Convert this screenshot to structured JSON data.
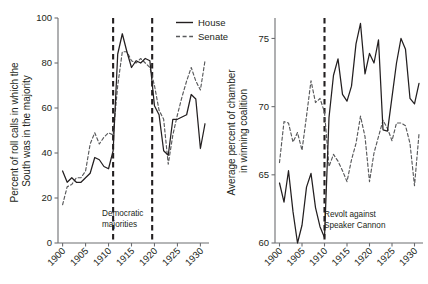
{
  "figure": {
    "title": "",
    "background": "#ffffff",
    "house_color": "#231f20",
    "senate_color": "#58595b"
  },
  "legend": {
    "position": "top-center",
    "entries": [
      {
        "label": "House",
        "style": "solid"
      },
      {
        "label": "Senate",
        "style": "dashed"
      }
    ]
  },
  "chart_data": [
    {
      "type": "line",
      "panel": "left",
      "title": "",
      "xlabel": "",
      "ylabel": "Percent of roll calls in which the South was in the majority",
      "xlim": [
        1899,
        1931
      ],
      "ylim": [
        0,
        100
      ],
      "xticks": [
        1900,
        1905,
        1910,
        1915,
        1920,
        1925,
        1930
      ],
      "xticklabels": [
        "1900",
        "1905",
        "1910",
        "1915",
        "1920",
        "1925",
        "1930"
      ],
      "yticks": [
        0,
        20,
        40,
        60,
        80,
        100
      ],
      "yticklabels": [
        "0",
        "20",
        "40",
        "60",
        "80",
        "100"
      ],
      "grid": false,
      "annotations": [
        {
          "text": "Democratic majorities",
          "x": 1915,
          "y": 12,
          "lines": [
            "Democratic",
            "majorities"
          ]
        }
      ],
      "vlines": [
        {
          "x": 1911,
          "style": "dashed"
        },
        {
          "x": 1919.5,
          "style": "dashed"
        }
      ],
      "x": [
        1900,
        1901,
        1902,
        1903,
        1904,
        1905,
        1906,
        1907,
        1908,
        1909,
        1910,
        1911,
        1912,
        1913,
        1914,
        1915,
        1916,
        1917,
        1918,
        1919,
        1920,
        1921,
        1922,
        1923,
        1924,
        1925,
        1926,
        1927,
        1928,
        1929,
        1930,
        1931
      ],
      "series": [
        {
          "name": "House",
          "style": "solid",
          "values": [
            32,
            27,
            29,
            27,
            27,
            29,
            31,
            38,
            37,
            34,
            33,
            41,
            84,
            93,
            85,
            78,
            81,
            80,
            82,
            81,
            61,
            57,
            41,
            39,
            55,
            55,
            56,
            57,
            66,
            64,
            42,
            53
          ]
        },
        {
          "name": "Senate",
          "style": "dashed",
          "values": [
            17,
            25,
            26,
            29,
            29,
            32,
            44,
            49,
            44,
            47,
            49,
            48,
            70,
            85,
            85,
            81,
            80,
            82,
            80,
            78,
            70,
            59,
            55,
            35,
            48,
            57,
            65,
            72,
            78,
            72,
            68,
            81
          ]
        }
      ]
    },
    {
      "type": "line",
      "panel": "right",
      "title": "",
      "xlabel": "",
      "ylabel": "Average percent of chamber in winning coalition",
      "xlim": [
        1899,
        1931
      ],
      "ylim": [
        60,
        76.5
      ],
      "xticks": [
        1900,
        1905,
        1910,
        1915,
        1920,
        1925,
        1930
      ],
      "xticklabels": [
        "1900",
        "1905",
        "1910",
        "1915",
        "1920",
        "1925",
        "1930"
      ],
      "yticks": [
        60,
        65,
        70,
        75
      ],
      "yticklabels": [
        "60",
        "65",
        "70",
        "75"
      ],
      "grid": false,
      "annotations": [
        {
          "text": "Revolt against Speaker Cannon",
          "x": 1912,
          "y": 61.5,
          "lines": [
            "Revolt against",
            "Speaker Cannon"
          ]
        }
      ],
      "vlines": [
        {
          "x": 1910,
          "style": "dashed"
        }
      ],
      "x": [
        1900,
        1901,
        1902,
        1903,
        1904,
        1905,
        1906,
        1907,
        1908,
        1909,
        1910,
        1911,
        1912,
        1913,
        1914,
        1915,
        1916,
        1917,
        1918,
        1919,
        1920,
        1921,
        1922,
        1923,
        1924,
        1925,
        1926,
        1927,
        1928,
        1929,
        1930,
        1931
      ],
      "series": [
        {
          "name": "House",
          "style": "solid",
          "values": [
            64.4,
            63.0,
            65.3,
            62.3,
            60.0,
            61.3,
            64.1,
            65.1,
            62.6,
            61.2,
            60.4,
            69.2,
            72.3,
            73.5,
            70.9,
            70.4,
            71.5,
            74.6,
            76.1,
            72.4,
            73.9,
            73.2,
            74.9,
            68.3,
            68.2,
            70.7,
            73.2,
            75.0,
            74.2,
            70.6,
            70.2,
            71.7
          ]
        },
        {
          "name": "Senate",
          "style": "dashed",
          "values": [
            65.9,
            68.9,
            68.8,
            67.4,
            68.1,
            66.8,
            69.3,
            71.9,
            70.3,
            70.6,
            69.6,
            65.6,
            66.5,
            66.0,
            65.3,
            64.5,
            66.1,
            67.3,
            69.3,
            67.8,
            64.5,
            66.6,
            67.8,
            69.0,
            68.4,
            67.5,
            68.8,
            68.8,
            68.6,
            67.3,
            64.2,
            68.0
          ]
        }
      ]
    }
  ]
}
